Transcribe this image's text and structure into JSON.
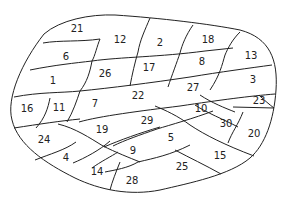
{
  "diagram": {
    "type": "region-map",
    "regions": [
      {
        "id": "21",
        "x": 77,
        "y": 32
      },
      {
        "id": "12",
        "x": 120,
        "y": 40
      },
      {
        "id": "2",
        "x": 160,
        "y": 43
      },
      {
        "id": "18",
        "x": 208,
        "y": 40
      },
      {
        "id": "13",
        "x": 251,
        "y": 56
      },
      {
        "id": "6",
        "x": 66,
        "y": 57
      },
      {
        "id": "26",
        "x": 105,
        "y": 74
      },
      {
        "id": "17",
        "x": 149,
        "y": 68
      },
      {
        "id": "8",
        "x": 202,
        "y": 62
      },
      {
        "id": "3",
        "x": 253,
        "y": 80
      },
      {
        "id": "1",
        "x": 53,
        "y": 81
      },
      {
        "id": "22",
        "x": 138,
        "y": 96
      },
      {
        "id": "27",
        "x": 193,
        "y": 88
      },
      {
        "id": "23",
        "x": 259,
        "y": 101
      },
      {
        "id": "16",
        "x": 27,
        "y": 109
      },
      {
        "id": "11",
        "x": 59,
        "y": 108
      },
      {
        "id": "7",
        "x": 95,
        "y": 104
      },
      {
        "id": "29",
        "x": 147,
        "y": 121
      },
      {
        "id": "10",
        "x": 201,
        "y": 109
      },
      {
        "id": "30",
        "x": 226,
        "y": 124
      },
      {
        "id": "19",
        "x": 102,
        "y": 130
      },
      {
        "id": "5",
        "x": 171,
        "y": 138
      },
      {
        "id": "20",
        "x": 254,
        "y": 134
      },
      {
        "id": "24",
        "x": 44,
        "y": 140
      },
      {
        "id": "9",
        "x": 133,
        "y": 151
      },
      {
        "id": "15",
        "x": 220,
        "y": 156
      },
      {
        "id": "4",
        "x": 66,
        "y": 158
      },
      {
        "id": "25",
        "x": 182,
        "y": 167
      },
      {
        "id": "14",
        "x": 97,
        "y": 172
      },
      {
        "id": "28",
        "x": 132,
        "y": 181
      }
    ]
  }
}
